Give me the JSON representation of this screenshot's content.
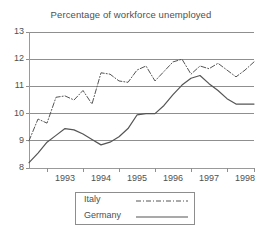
{
  "chart_data": {
    "type": "line",
    "title": "Percentage of workforce unemployed",
    "xlabel": "",
    "ylabel": "",
    "xlim": [
      1992.5,
      1998.75
    ],
    "ylim": [
      8,
      13
    ],
    "yticks": [
      8,
      9,
      10,
      11,
      12,
      13
    ],
    "ytick_labels": [
      "8",
      "9",
      "10",
      "11",
      "12",
      "13"
    ],
    "xticks": [
      1993,
      1994,
      1995,
      1996,
      1997,
      1998
    ],
    "xtick_labels": [
      "1993",
      "1994",
      "1995",
      "1996",
      "1997",
      "1998"
    ],
    "grid": true,
    "grid_axis": "y",
    "legend_position": "below-center",
    "series": [
      {
        "name": "Italy",
        "style": "dash-dot",
        "color": "#555555",
        "x": [
          1992.5,
          1992.75,
          1993.0,
          1993.25,
          1993.5,
          1993.75,
          1994.0,
          1994.25,
          1994.5,
          1994.75,
          1995.0,
          1995.25,
          1995.5,
          1995.75,
          1996.0,
          1996.25,
          1996.5,
          1996.75,
          1997.0,
          1997.25,
          1997.5,
          1997.75,
          1998.0,
          1998.25,
          1998.5,
          1998.75
        ],
        "values": [
          9.0,
          9.8,
          9.65,
          10.6,
          10.65,
          10.5,
          10.85,
          10.35,
          11.5,
          11.45,
          11.2,
          11.15,
          11.6,
          11.75,
          11.2,
          11.55,
          11.9,
          12.0,
          11.45,
          11.75,
          11.65,
          11.85,
          11.6,
          11.35,
          11.6,
          11.9
        ]
      },
      {
        "name": "Germany",
        "style": "solid",
        "color": "#555555",
        "x": [
          1992.5,
          1992.75,
          1993.0,
          1993.25,
          1993.5,
          1993.75,
          1994.0,
          1994.25,
          1994.5,
          1994.75,
          1995.0,
          1995.25,
          1995.5,
          1995.75,
          1996.0,
          1996.25,
          1996.5,
          1996.75,
          1997.0,
          1997.25,
          1997.5,
          1997.75,
          1998.0,
          1998.25,
          1998.5,
          1998.75
        ],
        "values": [
          8.2,
          8.55,
          8.95,
          9.2,
          9.45,
          9.4,
          9.25,
          9.05,
          8.85,
          8.95,
          9.15,
          9.45,
          9.95,
          10.0,
          10.0,
          10.3,
          10.7,
          11.05,
          11.3,
          11.4,
          11.1,
          10.85,
          10.55,
          10.35,
          10.35,
          10.35
        ]
      }
    ]
  },
  "legend": {
    "items": [
      {
        "label": "Italy"
      },
      {
        "label": "Germany"
      }
    ]
  }
}
